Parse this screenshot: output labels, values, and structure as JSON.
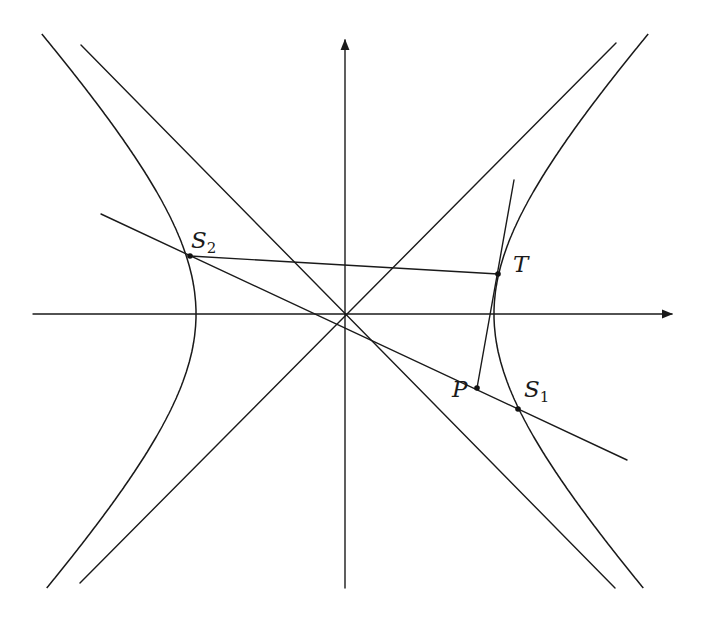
{
  "figure": {
    "type": "hyperbola-tangent-secant-diagram",
    "background": "#ffffff",
    "ink": "#1a1a1a",
    "origin": [
      345,
      314
    ],
    "hyperbola": {
      "a": 149,
      "b": 158,
      "y_range": [
        -280,
        275
      ]
    },
    "axes": {
      "x_axis": {
        "from": [
          33,
          314
        ],
        "to": [
          672,
          314
        ],
        "arrow": true
      },
      "y_axis": {
        "from": [
          345,
          588
        ],
        "to": [
          345,
          40
        ],
        "arrow": true
      }
    },
    "asymptotes": [
      {
        "name": "asymptote-positive-slope",
        "from": [
          80,
          583
        ],
        "to": [
          616,
          43
        ]
      },
      {
        "name": "asymptote-negative-slope",
        "from": [
          81,
          45
        ],
        "to": [
          615,
          588
        ]
      }
    ],
    "segments": [
      {
        "name": "secant-line-s2-s1",
        "from": [
          101,
          214
        ],
        "to": [
          627,
          460
        ]
      },
      {
        "name": "chord-s2-t",
        "from": [
          190,
          256
        ],
        "to": [
          498,
          274
        ]
      },
      {
        "name": "tangent-line-at-t",
        "from": [
          514,
          180
        ],
        "to": [
          477,
          388
        ]
      }
    ],
    "points": [
      {
        "id": "S2",
        "name": "point-s2",
        "pos": [
          190,
          256
        ],
        "label": "S",
        "sub": "2",
        "label_pos": [
          191,
          248
        ]
      },
      {
        "id": "T",
        "name": "point-t",
        "pos": [
          498,
          274
        ],
        "label": "T",
        "sub": "",
        "label_pos": [
          513,
          272
        ]
      },
      {
        "id": "P",
        "name": "point-p",
        "pos": [
          477,
          388
        ],
        "label": "P",
        "sub": "",
        "label_pos": [
          452,
          397
        ]
      },
      {
        "id": "S1",
        "name": "point-s1",
        "pos": [
          518,
          409
        ],
        "label": "S",
        "sub": "1",
        "label_pos": [
          524,
          397
        ]
      }
    ]
  },
  "labels": {
    "S2": "S",
    "S2_sub": "2",
    "T": "T",
    "P": "P",
    "S1": "S",
    "S1_sub": "1"
  }
}
